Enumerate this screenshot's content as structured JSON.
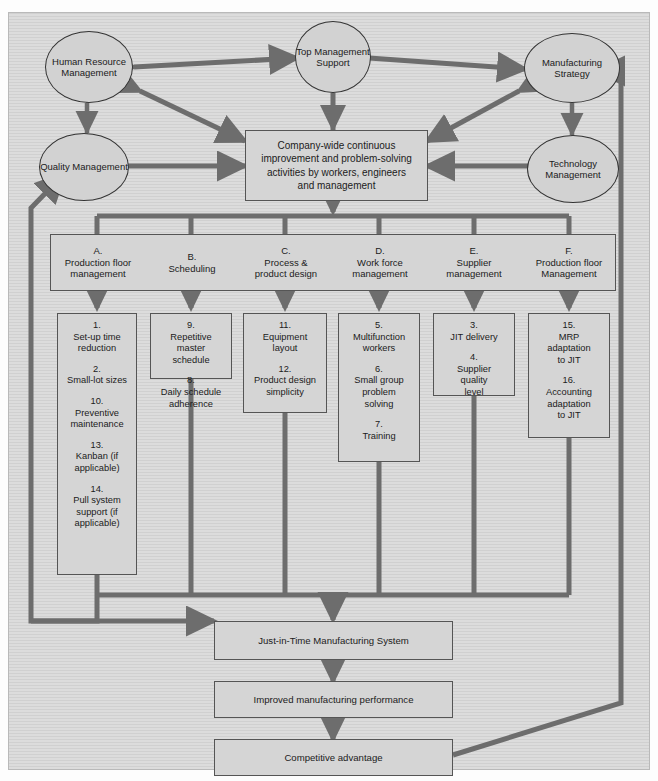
{
  "figure": {
    "faint_header": "",
    "background_color": "#dcdcdc",
    "node_fill": "#d5d5d5",
    "line_color": "#6d6d6d",
    "border_color": "#555555"
  },
  "drivers": [
    {
      "id": "hrm",
      "label": "Human\nResource\nManagement",
      "name": "human-resource-management"
    },
    {
      "id": "tms",
      "label": "Top\nManagement\nSupport",
      "name": "top-management-support"
    },
    {
      "id": "ms",
      "label": "Manufacturing\nStrategy",
      "name": "manufacturing-strategy"
    },
    {
      "id": "qm",
      "label": "Quality\nManagement",
      "name": "quality-management"
    },
    {
      "id": "tm",
      "label": "Technology\nManagement",
      "name": "technology-management"
    }
  ],
  "center": {
    "label": "Company-wide continuous improvement and problem-solving activities by workers, engineers and management",
    "lines": [
      "Company-wide continuous",
      "improvement and problem-solving",
      "activities by workers, engineers",
      "and management"
    ]
  },
  "columns": [
    {
      "letter": "A.",
      "title_lines": [
        "Production floor",
        "management"
      ]
    },
    {
      "letter": "B.",
      "title_lines": [
        "Scheduling"
      ]
    },
    {
      "letter": "C.",
      "title_lines": [
        "Process &",
        "product design"
      ]
    },
    {
      "letter": "D.",
      "title_lines": [
        "Work force",
        "management"
      ]
    },
    {
      "letter": "E.",
      "title_lines": [
        "Supplier",
        "management"
      ]
    },
    {
      "letter": "F.",
      "title_lines": [
        "Production floor",
        "Management"
      ]
    }
  ],
  "practices": {
    "A": [
      {
        "num": "1.",
        "lines": [
          "Set-up time",
          "reduction"
        ]
      },
      {
        "num": "2.",
        "lines": [
          "Small-lot sizes"
        ]
      },
      {
        "num": "10.",
        "lines": [
          "Preventive",
          "maintenance"
        ]
      },
      {
        "num": "13.",
        "lines": [
          "Kanban (if",
          "applicable)"
        ]
      },
      {
        "num": "14.",
        "lines": [
          "Pull system",
          "support (if",
          "applicable)"
        ]
      }
    ],
    "B": [
      {
        "num": "9.",
        "lines": [
          "Repetitive",
          "master",
          "schedule"
        ]
      },
      {
        "num": "8.",
        "lines": [
          "Daily schedule",
          "adherence"
        ]
      }
    ],
    "C": [
      {
        "num": "11.",
        "lines": [
          "Equipment",
          "layout"
        ]
      },
      {
        "num": "12.",
        "lines": [
          "Product design",
          "simplicity"
        ]
      }
    ],
    "D": [
      {
        "num": "5.",
        "lines": [
          "Multifunction",
          "workers"
        ]
      },
      {
        "num": "6.",
        "lines": [
          "Small group",
          "problem",
          "solving"
        ]
      },
      {
        "num": "7.",
        "lines": [
          "Training"
        ]
      }
    ],
    "E": [
      {
        "num": "3.",
        "lines": [
          "JIT delivery"
        ]
      },
      {
        "num": "4.",
        "lines": [
          "Supplier",
          "quality",
          "level"
        ]
      }
    ],
    "F": [
      {
        "num": "15.",
        "lines": [
          "MRP",
          "adaptation",
          "to JIT"
        ]
      },
      {
        "num": "16.",
        "lines": [
          "Accounting",
          "adaptation",
          "to JIT"
        ]
      }
    ]
  },
  "outcomes": [
    {
      "id": "jit",
      "label": "Just-in-Time Manufacturing System",
      "name": "jit-manufacturing-system"
    },
    {
      "id": "perf",
      "label": "Improved manufacturing performance",
      "name": "improved-manufacturing-performance"
    },
    {
      "id": "adv",
      "label": "Competitive advantage",
      "name": "competitive-advantage"
    }
  ]
}
